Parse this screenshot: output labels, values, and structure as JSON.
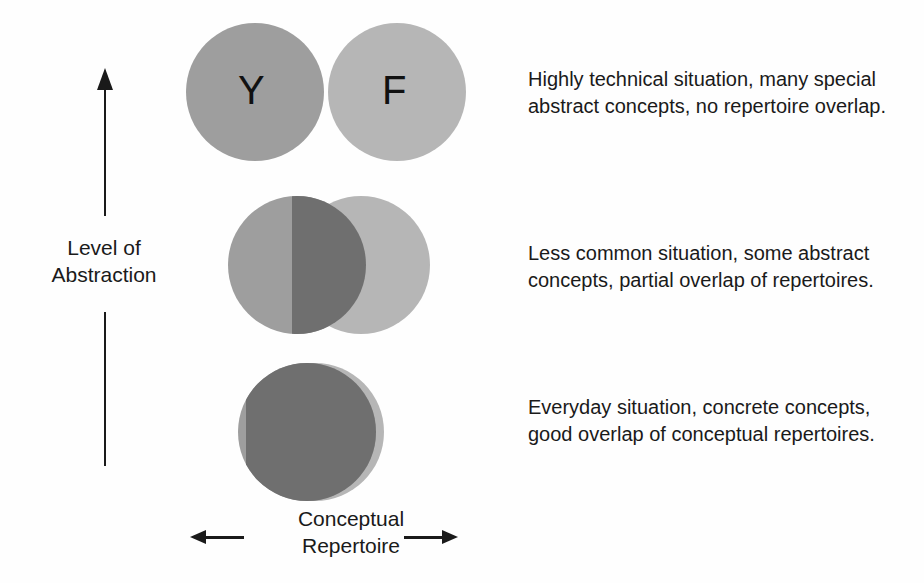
{
  "figure": {
    "background_color": "#fefefe",
    "text_color": "#1a1a1a"
  },
  "axes": {
    "vertical": {
      "label": "Level of\nAbstraction",
      "direction": "up",
      "arrow_icon": "arrow-up-icon"
    },
    "horizontal": {
      "label": "Conceptual\nRepertoire",
      "left_arrow_icon": "arrow-left-icon",
      "right_arrow_icon": "arrow-right-icon"
    }
  },
  "colors": {
    "circle_y": "#9e9e9e",
    "circle_f": "#b6b6b6",
    "overlap": "#6f6f6f"
  },
  "rows": [
    {
      "id": "top",
      "overlap_state": "none",
      "labels": {
        "left": "Y",
        "right": "F"
      },
      "caption": "Highly technical situation, many special\nabstract concepts, no repertoire overlap."
    },
    {
      "id": "middle",
      "overlap_state": "partial",
      "labels": {
        "left": "",
        "right": ""
      },
      "caption": "Less common situation, some abstract\nconcepts, partial overlap of repertoires."
    },
    {
      "id": "bottom",
      "overlap_state": "near-complete",
      "labels": {
        "left": "",
        "right": ""
      },
      "caption": "Everyday situation, concrete concepts,\ngood overlap of conceptual repertoires."
    }
  ]
}
